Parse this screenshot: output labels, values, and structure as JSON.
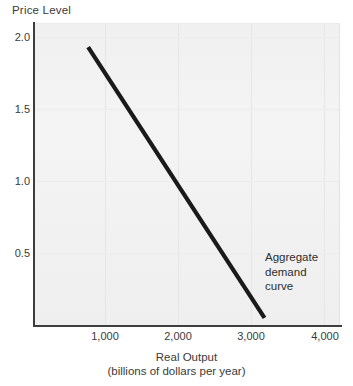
{
  "chart_data": {
    "type": "line",
    "title": "",
    "ylabel": "Price Level",
    "xlabel": "Real Output",
    "xlabel_sub": "(billions of dollars per year)",
    "xlim": [
      0,
      4300
    ],
    "ylim": [
      0,
      2.15
    ],
    "grid": true,
    "legend": "none",
    "x_ticks": [
      {
        "value": 1000,
        "label": "1,000"
      },
      {
        "value": 2000,
        "label": "2,000"
      },
      {
        "value": 3000,
        "label": "3,000"
      },
      {
        "value": 4000,
        "label": "4,000"
      }
    ],
    "y_ticks": [
      {
        "value": 2.0,
        "label": "2.0"
      },
      {
        "value": 1.5,
        "label": "1.5"
      },
      {
        "value": 1.0,
        "label": "1.0"
      },
      {
        "value": 0.5,
        "label": "0.5"
      }
    ],
    "series": [
      {
        "name": "Aggregate demand curve",
        "type": "line",
        "color": "#1a1a1a",
        "line_width": 4,
        "points": [
          {
            "x": 770,
            "y": 1.93
          },
          {
            "x": 3175,
            "y": 0.05
          }
        ]
      }
    ],
    "annotations": [
      {
        "name": "aggregate-demand-curve-label",
        "lines": [
          "Aggregate",
          "demand",
          "curve"
        ],
        "x": 3200,
        "y": 0.55
      }
    ]
  },
  "annotation_lines": {
    "line1": "Aggregate",
    "line2": "demand",
    "line3": "curve"
  },
  "axis": {
    "y_title": "Price Level",
    "x_title": "Real Output",
    "x_subtitle": "(billions of dollars per year)",
    "y_tick_0": "2.0",
    "y_tick_1": "1.5",
    "y_tick_2": "1.0",
    "y_tick_3": "0.5",
    "x_tick_0": "1,000",
    "x_tick_1": "2,000",
    "x_tick_2": "3,000",
    "x_tick_3": "4,000"
  },
  "colors": {
    "curve": "#1a1a1a",
    "axis": "#3d3d3d",
    "plot_bg": "#f2f2f2",
    "grid": "#e6e6e6",
    "text": "#2e2e2e"
  }
}
